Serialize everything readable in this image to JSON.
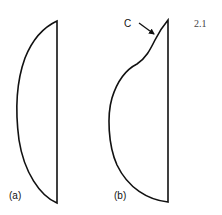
{
  "figure": {
    "number": "2.1",
    "shapes": [
      {
        "id": "a",
        "label": "(a)"
      },
      {
        "id": "b",
        "label": "(b)",
        "annotation": {
          "label": "C"
        }
      }
    ]
  }
}
